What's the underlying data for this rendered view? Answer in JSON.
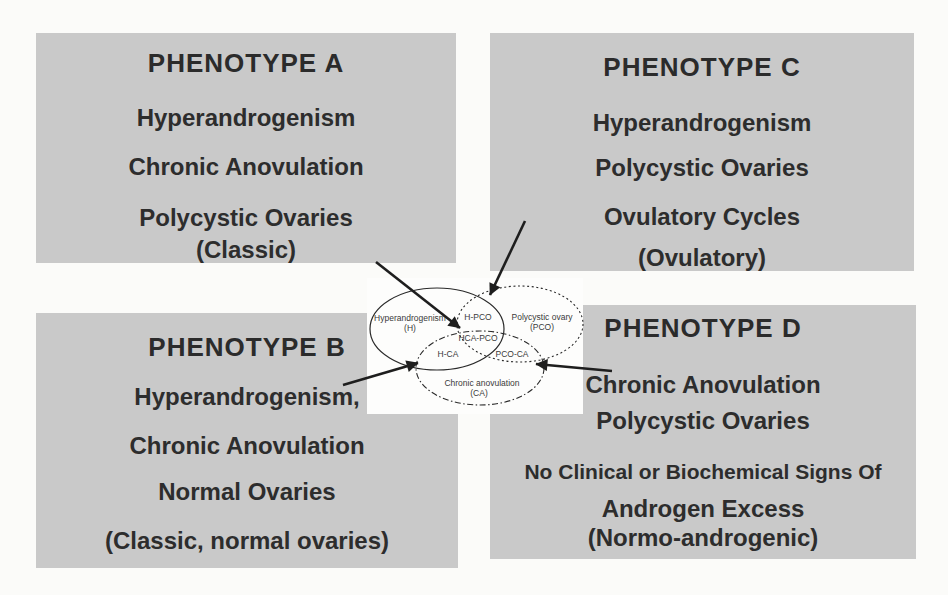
{
  "panel_a": {
    "title": "PHENOTYPE A",
    "lines": [
      "Hyperandrogenism",
      "Chronic Anovulation",
      "Polycystic Ovaries",
      "(Classic)"
    ]
  },
  "panel_c": {
    "title": "PHENOTYPE C",
    "lines": [
      "Hyperandrogenism",
      "Polycystic Ovaries",
      "Ovulatory Cycles",
      "(Ovulatory)"
    ]
  },
  "panel_b": {
    "title": "PHENOTYPE B",
    "lines": [
      "Hyperandrogenism,",
      "Chronic Anovulation",
      "Normal Ovaries",
      "(Classic, normal ovaries)"
    ]
  },
  "panel_d": {
    "title": "PHENOTYPE D",
    "lines": [
      "Chronic Anovulation",
      "Polycystic Ovaries",
      "No Clinical or Biochemical Signs Of",
      "Androgen Excess",
      "(Normo-androgenic)"
    ]
  },
  "venn": {
    "sets": [
      {
        "name": "hyperandrogenism",
        "label": "Hyperandrogenism",
        "abbr": "(H)",
        "outline": "solid"
      },
      {
        "name": "polycystic-ovary",
        "label": "Polycystic ovary",
        "abbr": "(PCO)",
        "outline": "dotted"
      },
      {
        "name": "chronic-anovulation",
        "label": "Chronic anovulation",
        "abbr": "(CA)",
        "outline": "dash-dot"
      }
    ],
    "regions": [
      "H-PCO",
      "HCA-PCO",
      "H-CA",
      "PCO-CA"
    ],
    "arrows": [
      {
        "from": "PHENOTYPE A",
        "to": "HCA-PCO"
      },
      {
        "from": "PHENOTYPE C",
        "to": "H-PCO"
      },
      {
        "from": "PHENOTYPE B",
        "to": "H-CA"
      },
      {
        "from": "PHENOTYPE D",
        "to": "PCO-CA"
      }
    ]
  },
  "colors": {
    "page_bg": "#fbfbf9",
    "panel_bg": "#c9c9c9",
    "panel_text": "#2d2d2d",
    "diagram_bg": "#fdfdfc",
    "line_color": "#1e1e1e"
  }
}
